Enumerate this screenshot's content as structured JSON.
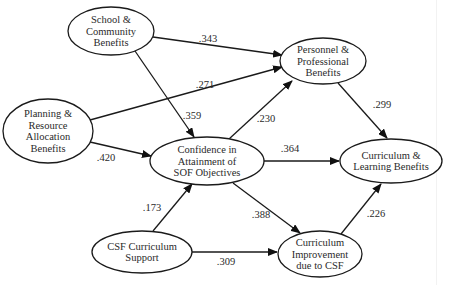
{
  "diagram": {
    "type": "path-model",
    "nodes": [
      {
        "id": "school",
        "lines": [
          "School &",
          "Community",
          "Benefits"
        ],
        "cx": 111,
        "cy": 31,
        "rx": 43,
        "ry": 24
      },
      {
        "id": "planning",
        "lines": [
          "Planning &",
          "Resource",
          "Allocation",
          "Benefits"
        ],
        "cx": 48,
        "cy": 131,
        "rx": 45,
        "ry": 32
      },
      {
        "id": "personnel",
        "lines": [
          "Personnel &",
          "Professional",
          "Benefits"
        ],
        "cx": 323,
        "cy": 61,
        "rx": 43,
        "ry": 23
      },
      {
        "id": "confidence",
        "lines": [
          "Confidence in",
          "Attainment of",
          "SOF Objectives"
        ],
        "cx": 207,
        "cy": 161,
        "rx": 57,
        "ry": 24
      },
      {
        "id": "curriculum_learning",
        "lines": [
          "Curriculum &",
          "Learning Benefits"
        ],
        "cx": 391,
        "cy": 161,
        "rx": 51,
        "ry": 22
      },
      {
        "id": "csf_support",
        "lines": [
          "CSF Curriculum",
          "Support"
        ],
        "cx": 142,
        "cy": 252,
        "rx": 50,
        "ry": 21
      },
      {
        "id": "curriculum_improvement",
        "lines": [
          "Curriculum",
          "Improvement",
          "due to CSF"
        ],
        "cx": 320,
        "cy": 254,
        "rx": 42,
        "ry": 23
      }
    ],
    "edges": [
      {
        "from": "school",
        "to": "personnel",
        "label": ".343",
        "x1": 153,
        "y1": 37,
        "x2": 282,
        "y2": 55,
        "lx": 208,
        "ly": 42
      },
      {
        "from": "planning",
        "to": "personnel",
        "label": ".271",
        "x1": 90,
        "y1": 120,
        "x2": 282,
        "y2": 67,
        "lx": 205,
        "ly": 88
      },
      {
        "from": "school",
        "to": "confidence",
        "label": ".359",
        "x1": 135,
        "y1": 51,
        "x2": 194,
        "y2": 137,
        "lx": 192,
        "ly": 119
      },
      {
        "from": "planning",
        "to": "confidence",
        "label": ".420",
        "x1": 90,
        "y1": 142,
        "x2": 151,
        "y2": 156,
        "lx": 106,
        "ly": 161
      },
      {
        "from": "confidence",
        "to": "personnel",
        "label": ".230",
        "x1": 229,
        "y1": 139,
        "x2": 292,
        "y2": 81,
        "lx": 266,
        "ly": 122
      },
      {
        "from": "personnel",
        "to": "curriculum_learning",
        "label": ".299",
        "x1": 338,
        "y1": 83,
        "x2": 387,
        "y2": 138,
        "lx": 382,
        "ly": 108
      },
      {
        "from": "confidence",
        "to": "curriculum_learning",
        "label": ".364",
        "x1": 264,
        "y1": 161,
        "x2": 339,
        "y2": 161,
        "lx": 290,
        "ly": 152
      },
      {
        "from": "confidence",
        "to": "curriculum_improvement",
        "label": ".388",
        "x1": 233,
        "y1": 183,
        "x2": 300,
        "y2": 233,
        "lx": 261,
        "ly": 218
      },
      {
        "from": "csf_support",
        "to": "confidence",
        "label": ".173",
        "x1": 153,
        "y1": 231,
        "x2": 192,
        "y2": 184,
        "lx": 152,
        "ly": 211
      },
      {
        "from": "csf_support",
        "to": "curriculum_improvement",
        "label": ".309",
        "x1": 192,
        "y1": 252,
        "x2": 277,
        "y2": 252,
        "lx": 226,
        "ly": 265
      },
      {
        "from": "curriculum_improvement",
        "to": "curriculum_learning",
        "label": ".226",
        "x1": 341,
        "y1": 234,
        "x2": 381,
        "y2": 184,
        "lx": 376,
        "ly": 217
      }
    ]
  }
}
